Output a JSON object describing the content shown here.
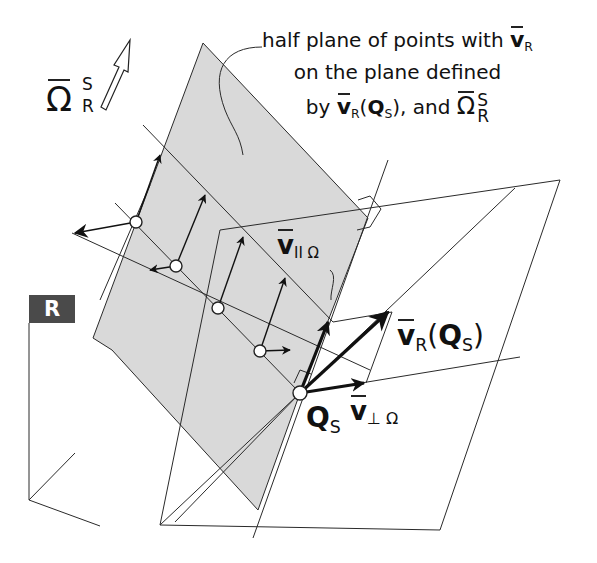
{
  "diagram": {
    "callout": {
      "line1_text": "half plane of points with",
      "line1_symbol": "v",
      "line1_symbol_sub": "R",
      "line2_text": "on the plane defined",
      "line3_prefix": "by",
      "line3_symbol": "v",
      "line3_symbol_sub": "R",
      "line3_arg": "Q",
      "line3_arg_sub": "S",
      "line3_mid": "), and",
      "line3_omega": "Ω",
      "line3_omega_sup": "S",
      "line3_omega_sub": "R"
    },
    "omega_label": {
      "symbol": "Ω",
      "sup": "S",
      "sub": "R"
    },
    "frame_label": "R",
    "labels": {
      "v_parallel": {
        "symbol": "v",
        "sub": "II Ω"
      },
      "v_r_qs": {
        "symbol": "v",
        "sub": "R",
        "arg": "Q",
        "arg_sub": "S"
      },
      "v_perp": {
        "symbol": "v",
        "sub": "⊥ Ω"
      },
      "q_s": {
        "symbol": "Q",
        "sub": "S"
      }
    },
    "colors": {
      "half_plane_fill": "#d9d9d9",
      "line": "#2a2a2a",
      "frame_box": "#4a4a4a",
      "background": "#ffffff"
    }
  }
}
